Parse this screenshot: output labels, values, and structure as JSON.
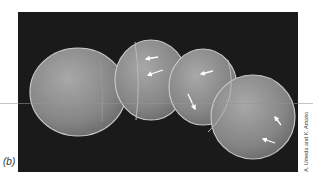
{
  "figure": {
    "panel_label": "(b)",
    "credit": "A. Umeda and K. Amako",
    "colors": {
      "background": "#1a1a1a",
      "cell_fill": "#8a8a8a",
      "cell_highlight": "#b5b5b5",
      "arrow": "#ffffff",
      "page": "#ffffff"
    },
    "arrow_count": 6
  }
}
